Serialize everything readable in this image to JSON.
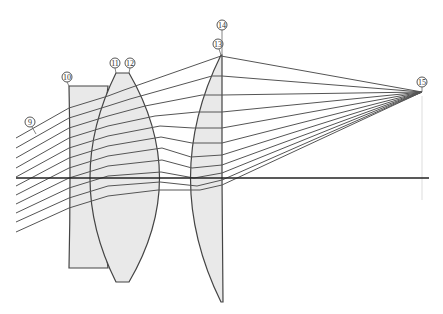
{
  "diagram": {
    "type": "optical-lens-ray-trace",
    "background": "#ffffff",
    "lens_fill": "#e9e9e9",
    "line_color": "#444444",
    "optical_axis": {
      "x1": 16,
      "y": 178,
      "x2": 429
    },
    "focal_point": {
      "x": 422,
      "y": 92
    },
    "labels": [
      {
        "id": "9",
        "text": "9",
        "cx": 30,
        "cy": 122,
        "leader_to": [
          32,
          131
        ]
      },
      {
        "id": "10",
        "text": "10",
        "cx": 67,
        "cy": 77,
        "leader_to": [
          69,
          86
        ]
      },
      {
        "id": "11",
        "text": "11",
        "cx": 115,
        "cy": 63,
        "leader_to": [
          116,
          73
        ]
      },
      {
        "id": "12",
        "text": "12",
        "cx": 130,
        "cy": 63,
        "leader_to": [
          129,
          73
        ]
      },
      {
        "id": "13",
        "text": "13",
        "cx": 218,
        "cy": 44,
        "leader_to": [
          221,
          55
        ]
      },
      {
        "id": "14",
        "text": "14",
        "cx": 222,
        "cy": 25,
        "leader_to": [
          222,
          44
        ]
      },
      {
        "id": "15",
        "text": "15",
        "cx": 422,
        "cy": 82,
        "leader_to": [
          422,
          92
        ]
      }
    ],
    "lenses": [
      {
        "name": "lens-element-10",
        "description": "meniscus/plano-concave element, flat top & bottom"
      },
      {
        "name": "lens-element-11-12",
        "description": "biconvex element"
      },
      {
        "name": "lens-element-13-14",
        "description": "plano-convex element, flat rear face"
      }
    ],
    "ray_count": 11
  }
}
